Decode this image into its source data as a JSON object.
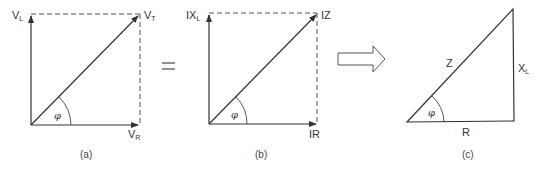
{
  "diagram": {
    "panel_a": {
      "caption": "(a)",
      "vertical_label": "V",
      "vertical_sub": "L",
      "diagonal_label": "V",
      "diagonal_sub": "T",
      "horizontal_label": "V",
      "horizontal_sub": "R",
      "angle_label": "φ"
    },
    "equals_sign": "=",
    "panel_b": {
      "caption": "(b)",
      "vertical_label": "IX",
      "vertical_sub": "L",
      "diagonal_label": "IZ",
      "horizontal_label": "IR",
      "angle_label": "φ"
    },
    "transform_arrow": "right-arrow",
    "panel_c": {
      "caption": "(c)",
      "hypotenuse_label": "Z",
      "vertical_label": "X",
      "vertical_sub": "L",
      "horizontal_label": "R",
      "angle_label": "φ"
    }
  }
}
